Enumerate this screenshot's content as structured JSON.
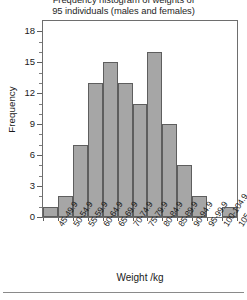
{
  "chart_data": {
    "type": "bar",
    "title": "Frequency histogram of weights of 95 individuals (males and females)",
    "title_lines": [
      "Frequency histogram of weights of",
      "95 individuals (males and females)"
    ],
    "xlabel": "Weight /kg",
    "ylabel": "Frequency",
    "categories": [
      "45-49.9",
      "50-54.9",
      "55-59.9",
      "60-64.9",
      "65-69.9",
      "70-74.9",
      "75-79.9",
      "80-84.9",
      "85-89.9",
      "90-94.9",
      "95-99.9",
      "100-104.9",
      "105-109.9"
    ],
    "values": [
      1,
      2,
      7,
      13,
      15,
      13,
      11,
      16,
      9,
      5,
      2,
      0,
      1
    ],
    "ylim": [
      0,
      19
    ],
    "y_major_ticks": [
      0,
      3,
      6,
      9,
      12,
      15,
      18
    ],
    "y_tick_labels": [
      "0",
      "3",
      "6",
      "9",
      "12",
      "15",
      "18"
    ],
    "y_minor_step": 1,
    "grid": false,
    "legend": null,
    "total_count": 95,
    "bar_fill_color": "#a6a6a6",
    "bar_edge_color": "#5e5e5e",
    "frame_color": "#6e6e6e",
    "background_color": "#ffffff"
  }
}
